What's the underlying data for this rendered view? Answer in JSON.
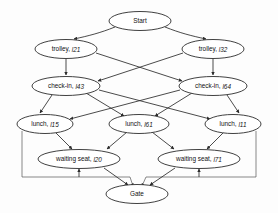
{
  "figure": {
    "type": "directed-graph",
    "title": "",
    "background": "#fdfdfd",
    "node_fill": "#ffffff",
    "node_stroke": "#2b2b2b",
    "edge_color": "#2b2b2b"
  },
  "nodes": [
    {
      "id": "start",
      "label": "Start",
      "sub": "",
      "cx": 140,
      "cy": 21,
      "rx": 31,
      "ry": 9.5,
      "level": 0
    },
    {
      "id": "trolley_l21",
      "label": "trolley, ",
      "sub": "l21",
      "cx": 66,
      "cy": 49,
      "rx": 31,
      "ry": 9.5,
      "level": 1
    },
    {
      "id": "trolley_l32",
      "label": "trolley, ",
      "sub": "l32",
      "cx": 213,
      "cy": 49,
      "rx": 31,
      "ry": 9.5,
      "level": 1
    },
    {
      "id": "checkin_l43",
      "label": "check-in, ",
      "sub": "l43",
      "cx": 66,
      "cy": 86,
      "rx": 34,
      "ry": 9.5,
      "level": 2
    },
    {
      "id": "checkin_l64",
      "label": "check-in, ",
      "sub": "l64",
      "cx": 213,
      "cy": 86,
      "rx": 34,
      "ry": 9.5,
      "level": 2
    },
    {
      "id": "lunch_l15",
      "label": "lunch, ",
      "sub": "l15",
      "cx": 45,
      "cy": 124,
      "rx": 28,
      "ry": 9.5,
      "level": 3
    },
    {
      "id": "lunch_l61",
      "label": "lunch, ",
      "sub": "l61",
      "cx": 139,
      "cy": 124,
      "rx": 30,
      "ry": 9.5,
      "level": 3
    },
    {
      "id": "lunch_l11",
      "label": "lunch, ",
      "sub": "l11",
      "cx": 233,
      "cy": 124,
      "rx": 28,
      "ry": 9.5,
      "level": 3
    },
    {
      "id": "wseat_l20",
      "label": "waiting seat, ",
      "sub": "l20",
      "cx": 79,
      "cy": 159,
      "rx": 41,
      "ry": 9.5,
      "level": 4
    },
    {
      "id": "wseat_l71",
      "label": "waiting seat, ",
      "sub": "l71",
      "cx": 199,
      "cy": 159,
      "rx": 41,
      "ry": 9.5,
      "level": 4
    },
    {
      "id": "gate",
      "label": "Gate",
      "sub": "",
      "cx": 137,
      "cy": 194,
      "rx": 31,
      "ry": 9.5,
      "level": 5
    }
  ],
  "edges": [
    {
      "from": "start",
      "to": "trolley_l21"
    },
    {
      "from": "start",
      "to": "trolley_l32"
    },
    {
      "from": "trolley_l21",
      "to": "checkin_l43"
    },
    {
      "from": "trolley_l21",
      "to": "checkin_l64"
    },
    {
      "from": "trolley_l32",
      "to": "checkin_l64"
    },
    {
      "from": "trolley_l32",
      "to": "checkin_l43"
    },
    {
      "from": "checkin_l43",
      "to": "lunch_l15"
    },
    {
      "from": "checkin_l43",
      "to": "lunch_l61"
    },
    {
      "from": "checkin_l43",
      "to": "lunch_l11"
    },
    {
      "from": "checkin_l64",
      "to": "lunch_l15"
    },
    {
      "from": "checkin_l64",
      "to": "lunch_l61"
    },
    {
      "from": "checkin_l64",
      "to": "lunch_l11"
    },
    {
      "from": "lunch_l15",
      "to": "wseat_l20"
    },
    {
      "from": "lunch_l61",
      "to": "wseat_l20"
    },
    {
      "from": "lunch_l61",
      "to": "wseat_l71"
    },
    {
      "from": "lunch_l11",
      "to": "wseat_l71"
    },
    {
      "from": "lunch_l15",
      "to": "gate"
    },
    {
      "from": "lunch_l11",
      "to": "gate"
    },
    {
      "from": "wseat_l20",
      "to": "gate"
    },
    {
      "from": "wseat_l71",
      "to": "gate"
    }
  ]
}
